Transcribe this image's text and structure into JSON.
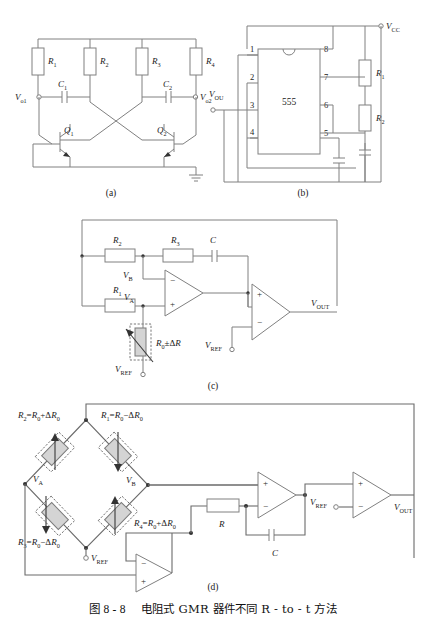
{
  "figure": {
    "caption_prefix": "图 8 - 8",
    "caption_text": "电阻式 GMR 器件不同 R - to - t 方法",
    "panels": [
      {
        "id": "a",
        "label": "(a)",
        "title": "astable-multivibrator-cross-coupled"
      },
      {
        "id": "b",
        "label": "(b)",
        "title": "555-timer-oscillator"
      },
      {
        "id": "c",
        "label": "(c)",
        "title": "single-gmr-resistor-to-time"
      },
      {
        "id": "d",
        "label": "(d)",
        "title": "gmr-wheatstone-bridge-to-time"
      }
    ]
  },
  "panel_a": {
    "label": "(a)",
    "resistors": [
      {
        "name": "R",
        "sub": "1"
      },
      {
        "name": "R",
        "sub": "2"
      },
      {
        "name": "R",
        "sub": "3"
      },
      {
        "name": "R",
        "sub": "4"
      }
    ],
    "capacitors": [
      {
        "name": "C",
        "sub": "1"
      },
      {
        "name": "C",
        "sub": "2"
      }
    ],
    "transistors": [
      {
        "name": "Q",
        "sub": "1"
      },
      {
        "name": "Q",
        "sub": "2"
      }
    ],
    "outputs": [
      {
        "name": "V",
        "sub": "o1"
      },
      {
        "name": "V",
        "sub": "o2"
      }
    ],
    "ground_icon": "ground-icon"
  },
  "panel_b": {
    "label": "(b)",
    "ic_label": "555",
    "pins": [
      "1",
      "2",
      "3",
      "4",
      "5",
      "6",
      "7",
      "8"
    ],
    "supply": {
      "name": "V",
      "sub": "CC"
    },
    "output": {
      "name": "V",
      "sub": "OU"
    },
    "resistors": [
      {
        "name": "R",
        "sub": "1"
      },
      {
        "name": "R",
        "sub": "2"
      }
    ],
    "capacitor_icons": [
      "capacitor-icon",
      "capacitor-icon"
    ]
  },
  "panel_c": {
    "label": "(c)",
    "resistors": [
      {
        "name": "R",
        "sub": "1"
      },
      {
        "name": "R",
        "sub": "2"
      },
      {
        "name": "R",
        "sub": "3"
      }
    ],
    "capacitor": {
      "name": "C",
      "sub": ""
    },
    "gmr_element": "R₀±ΔR",
    "gmr_element_parts": {
      "base": "R",
      "base_sub": "0",
      "delta": "±ΔR"
    },
    "nodes": [
      {
        "name": "V",
        "sub": "B"
      },
      {
        "name": "V",
        "sub": "A"
      }
    ],
    "v_ref_bottom": {
      "name": "V",
      "sub": "REF"
    },
    "v_ref_comparator": {
      "name": "V",
      "sub": "REF"
    },
    "v_out": {
      "name": "V",
      "sub": "OUT"
    },
    "op_signs": [
      "−",
      "+",
      "+",
      "−"
    ]
  },
  "panel_d": {
    "label": "(d)",
    "bridge_arms": [
      {
        "expr": "R₂=R₀+ΔR₀",
        "name": "R",
        "sub": "2",
        "rhs": "=R",
        "rhs_sub": "0",
        "tail": "+ΔR",
        "tail_sub": "0"
      },
      {
        "expr": "R₁=R₀−ΔR₀",
        "name": "R",
        "sub": "1",
        "rhs": "=R",
        "rhs_sub": "0",
        "tail": "−ΔR",
        "tail_sub": "0"
      },
      {
        "expr": "R₃=R₀−ΔR₀",
        "name": "R",
        "sub": "3",
        "rhs": "=R",
        "rhs_sub": "0",
        "tail": "−ΔR",
        "tail_sub": "0"
      },
      {
        "expr": "R₄=R₀+ΔR₀",
        "name": "R",
        "sub": "4",
        "rhs": "=R",
        "rhs_sub": "0",
        "tail": "+ΔR",
        "tail_sub": "0"
      }
    ],
    "nodes": [
      {
        "name": "V",
        "sub": "A"
      },
      {
        "name": "V",
        "sub": "B"
      }
    ],
    "v_ref_bridge": {
      "name": "V",
      "sub": "REF"
    },
    "v_ref_comparator": {
      "name": "V",
      "sub": "REF"
    },
    "v_out": {
      "name": "V",
      "sub": "OUT"
    },
    "resistor": {
      "name": "R",
      "sub": ""
    },
    "capacitor": {
      "name": "C",
      "sub": ""
    },
    "op_signs": [
      "+",
      "−",
      "−",
      "+",
      "+",
      "−"
    ]
  }
}
